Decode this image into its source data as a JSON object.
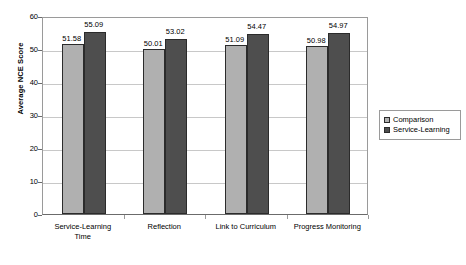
{
  "chart_data": {
    "type": "bar",
    "title": "",
    "xlabel": "",
    "ylabel": "Average NCE Score",
    "ylim": [
      0,
      60
    ],
    "yticks": [
      0,
      10,
      20,
      30,
      40,
      50,
      60
    ],
    "grid": true,
    "legend_position": "right",
    "categories": [
      "Service-Learning Time",
      "Reflection",
      "Link to Curriculum",
      "Progress Monitoring"
    ],
    "category_lines": [
      [
        "Service-Learning",
        "Time"
      ],
      [
        "Reflection"
      ],
      [
        "Link to Curriculum"
      ],
      [
        "Progress Monitoring"
      ]
    ],
    "series": [
      {
        "name": "Comparison",
        "color": "#b0b0b0",
        "values": [
          51.58,
          50.01,
          51.09,
          50.98
        ],
        "labels": [
          "51.58",
          "50.01",
          "51.09",
          "50.98"
        ]
      },
      {
        "name": "Service-Learning",
        "color": "#4e4e4e",
        "values": [
          55.09,
          53.02,
          54.47,
          54.97
        ],
        "labels": [
          "55.09",
          "53.02",
          "54.47",
          "54.97"
        ]
      }
    ]
  },
  "axis": {
    "y_title": "Average NCE Score",
    "y_tick_labels": [
      "60",
      "50",
      "40",
      "30",
      "20",
      "10",
      "0"
    ]
  },
  "legend": {
    "items": [
      {
        "label": "Comparison"
      },
      {
        "label": "Service-Learning"
      }
    ]
  }
}
